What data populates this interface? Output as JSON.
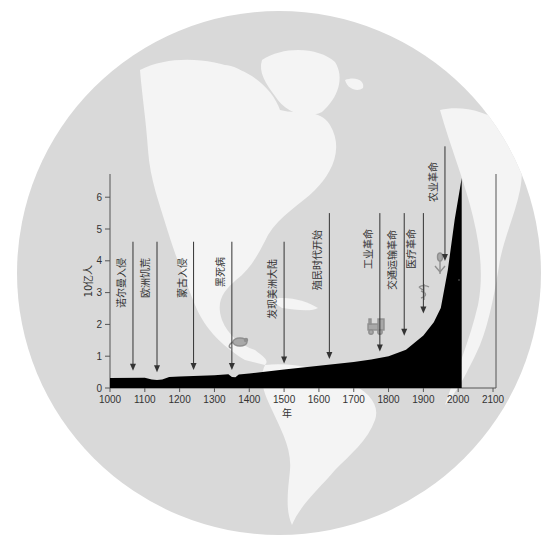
{
  "chart_data": {
    "type": "area",
    "title": "",
    "xlabel": "年",
    "ylabel": "10亿人",
    "xlim": [
      1000,
      2100
    ],
    "ylim": [
      0,
      6.8
    ],
    "grid": false,
    "legend": null,
    "x_ticks": [
      "1000",
      "1100",
      "1200",
      "1300",
      "1400",
      "1500",
      "1600",
      "1700",
      "1800",
      "1900",
      "2000",
      "2100"
    ],
    "y_ticks": [
      "0",
      "1",
      "2",
      "3",
      "4",
      "5",
      "6"
    ],
    "series": [
      {
        "name": "世界人口",
        "x": [
          1000,
          1100,
          1120,
          1135,
          1150,
          1170,
          1200,
          1300,
          1340,
          1350,
          1360,
          1370,
          1400,
          1500,
          1600,
          1700,
          1750,
          1800,
          1850,
          1900,
          1930,
          1950,
          1970,
          1990,
          2010
        ],
        "values": [
          0.31,
          0.32,
          0.27,
          0.25,
          0.27,
          0.35,
          0.36,
          0.4,
          0.43,
          0.35,
          0.34,
          0.42,
          0.46,
          0.58,
          0.7,
          0.82,
          0.9,
          1.0,
          1.2,
          1.65,
          2.07,
          2.52,
          3.7,
          5.3,
          6.6
        ]
      }
    ],
    "annotations": [
      {
        "year": 1066,
        "label": "诺尔曼入侵",
        "arrow_top": 4.6,
        "arrow_tip": 0.45
      },
      {
        "year": 1135,
        "label": "欧洲饥荒",
        "arrow_top": 4.6,
        "arrow_tip": 0.4
      },
      {
        "year": 1240,
        "label": "蒙古入侵",
        "arrow_top": 4.6,
        "arrow_tip": 0.47
      },
      {
        "year": 1350,
        "label": "黑死病",
        "arrow_top": 4.6,
        "arrow_tip": 0.47,
        "icon": "rat"
      },
      {
        "year": 1500,
        "label": "发现美洲大陆",
        "arrow_top": 4.6,
        "arrow_tip": 0.68
      },
      {
        "year": 1630,
        "label": "殖民时代开始",
        "arrow_top": 5.5,
        "arrow_tip": 0.82
      },
      {
        "year": 1775,
        "label": "工业革命",
        "arrow_top": 5.5,
        "arrow_tip": 1.05,
        "icon": "locomotive"
      },
      {
        "year": 1845,
        "label": "交通运输革命",
        "arrow_top": 5.5,
        "arrow_tip": 1.55
      },
      {
        "year": 1900,
        "label": "医疗革命",
        "arrow_top": 5.5,
        "arrow_tip": 2.25,
        "icon": "caduceus"
      },
      {
        "year": 1962,
        "label": "农业革命",
        "arrow_top": 7.6,
        "arrow_tip": 3.9,
        "icon": "wheat"
      }
    ]
  },
  "colors": {
    "background": "#ffffff",
    "globe_ocean": "#d9d9d9",
    "globe_land": "#f4f4f4",
    "area_fill": "#000000",
    "axis": "#555555",
    "icon": "#999999"
  }
}
